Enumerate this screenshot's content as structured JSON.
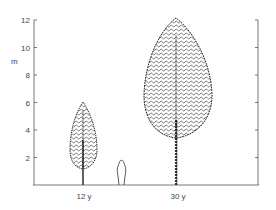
{
  "figure": {
    "y_axis": {
      "unit": "m",
      "ticks": [
        "2",
        "4",
        "6",
        "8",
        "10",
        "12"
      ]
    },
    "x_labels": [
      "12 y",
      "30 y"
    ],
    "trees": [
      {
        "age": "12 y",
        "height_m": 6
      },
      {
        "age": "30 y",
        "height_m": 12
      }
    ],
    "person": {
      "height_m": 1.8
    }
  }
}
